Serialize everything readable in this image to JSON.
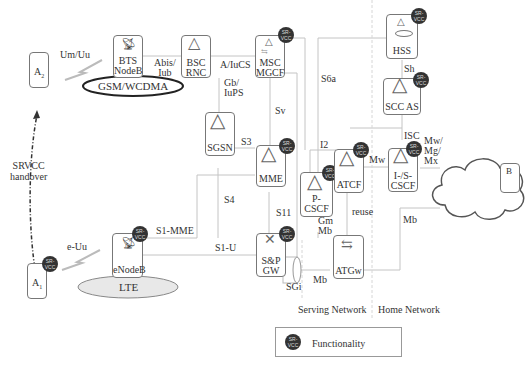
{
  "diagram": {
    "nodes": {
      "a2": {
        "label": "A",
        "sub": "2"
      },
      "a1": {
        "label": "A",
        "sub": "1"
      },
      "bts": {
        "line1": "BTS",
        "line2": "NodeB"
      },
      "bsc": {
        "line1": "BSC",
        "line2": "RNC"
      },
      "msc": {
        "line1": "MSC",
        "line2": "MGCF"
      },
      "hss": {
        "label": "HSS"
      },
      "sccas": {
        "label": "SCC AS"
      },
      "sgsn": {
        "label": "SGSN"
      },
      "mme": {
        "label": "MME"
      },
      "atcf": {
        "label": "ATCF"
      },
      "pcscf": {
        "label": "P-CSCF"
      },
      "iscscf": {
        "line1": "I-/S-",
        "line2": "CSCF"
      },
      "enodeb": {
        "label": "eNodeB"
      },
      "spgw": {
        "line1": "S&P",
        "line2": "GW"
      },
      "atgw": {
        "label": "ATGw"
      },
      "b": {
        "label": "B"
      }
    },
    "access_networks": {
      "gsm": "GSM/WCDMA",
      "lte": "LTE"
    },
    "interfaces": {
      "um_uu": "Um/Uu",
      "e_uu": "e-Uu",
      "abis_iub_1": "Abis/",
      "abis_iub_2": "Iub",
      "a_iucs": "A/IuCS",
      "gb_iups_1": "Gb/",
      "gb_iups_2": "IuPS",
      "s6a": "S6a",
      "sv": "Sv",
      "sh": "Sh",
      "s3": "S3",
      "s4": "S4",
      "s11": "S11",
      "i2": "I2",
      "isc": "ISC",
      "mw_1": "Mw",
      "mw_mg_mx_1": "Mw/",
      "mw_mg_mx_2": "Mg/",
      "mw_mg_mx_3": "Mx",
      "s1_mme": "S1-MME",
      "s1_u": "S1-U",
      "gm_mb_1": "Gm",
      "gm_mb_2": "Mb",
      "reuse": "reuse",
      "mb_1": "Mb",
      "mb_2": "Mb",
      "sgi": "SGi"
    },
    "handover": {
      "line1": "SRVCC",
      "line2": "handover"
    },
    "regions": {
      "serving": "Serving Network",
      "home": "Home Network"
    },
    "badge": {
      "line1": "SR-",
      "line2": "VCC"
    },
    "legend": {
      "label": "Functionality"
    },
    "colors": {
      "line": "#bbbbbb",
      "box": "#777777",
      "badge": "#333333",
      "text": "#333333"
    }
  }
}
